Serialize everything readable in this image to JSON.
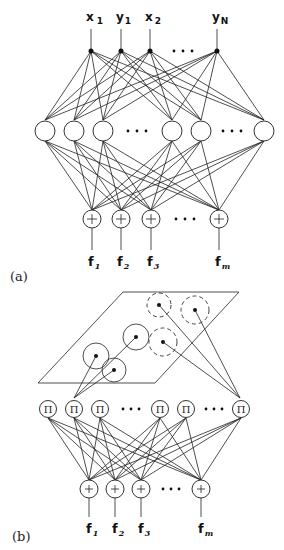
{
  "diagram": {
    "panel_a": {
      "label": "(a)",
      "inputs": [
        {
          "name": "x",
          "sub": "1"
        },
        {
          "name": "y",
          "sub": "1"
        },
        {
          "name": "x",
          "sub": "2"
        },
        {
          "name": "y",
          "sub": "N"
        }
      ],
      "ellipsis": "• • •",
      "hidden_layer": {
        "node_count_visible": 7,
        "ellipsis": "• • •"
      },
      "sum_nodes": {
        "symbol": "+",
        "count_visible": 4
      },
      "outputs": [
        {
          "name": "f",
          "sub": "1"
        },
        {
          "name": "f",
          "sub": "2"
        },
        {
          "name": "f",
          "sub": "3"
        },
        {
          "name": "f",
          "sub": "m"
        }
      ]
    },
    "panel_b": {
      "label": "(b)",
      "product_nodes": {
        "symbol": "Π",
        "count_visible": 7
      },
      "ellipsis": "• • •",
      "sum_nodes": {
        "symbol": "+",
        "count_visible": 4
      },
      "outputs": [
        {
          "name": "f",
          "sub": "1"
        },
        {
          "name": "f",
          "sub": "2"
        },
        {
          "name": "f",
          "sub": "3"
        },
        {
          "name": "f",
          "sub": "m"
        }
      ]
    }
  }
}
